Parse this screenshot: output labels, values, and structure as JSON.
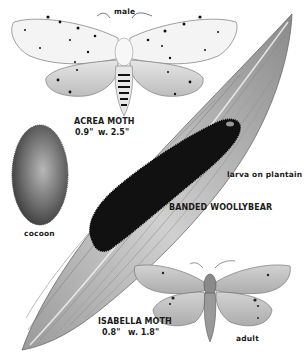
{
  "plate": {
    "subject": "Acrea Moth and Isabella Moth (Banded Woollybear) illustration plate",
    "palette": {
      "background": "#ffffff",
      "ink": "#1a1a1a",
      "leaf_light": "#c8c8c8",
      "leaf_dark": "#7a7a7a",
      "wing_white": "#f2f2f2",
      "isabella_wing": "#c4c4c4",
      "caterpillar": "#111111",
      "cocoon": "#6a6a6a"
    }
  },
  "labels": {
    "acrea_male": "male",
    "acrea_name": "ACREA MOTH",
    "acrea_length": "0.9\"",
    "acrea_wingspan": "w. 2.5\"",
    "cocoon": "cocoon",
    "larva": "larva on plantain",
    "woollybear": "BANDED WOOLLYBEAR",
    "isabella_name": "ISABELLA MOTH",
    "isabella_length": "0.8\"",
    "isabella_wingspan": "w. 1.8\"",
    "isabella_adult": "adult"
  }
}
